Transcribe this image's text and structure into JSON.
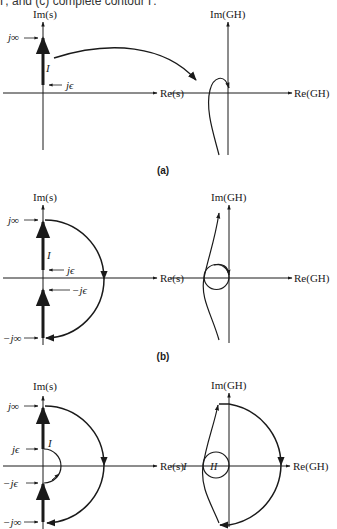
{
  "header": {
    "caption_fragment": "Γ, and (c) complete contour Γ."
  },
  "labels": {
    "im_s": "Im(s)",
    "re_s": "Re(s)",
    "im_gh": "Im(GH)",
    "re_gh": "Re(GH)",
    "j_inf": "j∞",
    "neg_j_inf": "−j∞",
    "j_eps": "jϵ",
    "neg_j_eps": "−jϵ",
    "region_I": "I",
    "region_II": "II"
  },
  "panels": [
    {
      "id": "a",
      "label": "(a)",
      "description": "Mapping of path I (positive imaginary axis from jϵ to j∞) into the GH-plane"
    },
    {
      "id": "b",
      "label": "(b)",
      "description": "Path I, infinite semicircle, and negative imaginary axis from −j∞ to −jϵ with its GH-plane image"
    },
    {
      "id": "c",
      "label": "",
      "description": "Complete contour Γ including small semicircle around origin and its GH-plane image with regions I and II"
    }
  ],
  "colors": {
    "ink": "#1a1a1a",
    "background": "#ffffff"
  }
}
